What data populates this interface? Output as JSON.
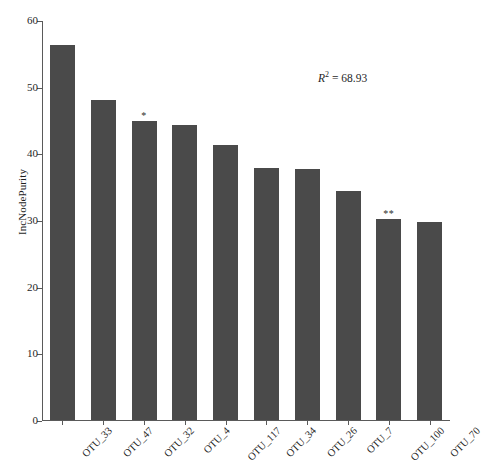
{
  "chart_data": {
    "type": "bar",
    "title": "",
    "xlabel": "",
    "ylabel": "IncNodePurity",
    "ylim": [
      0,
      60
    ],
    "yticks": [
      0,
      10,
      20,
      30,
      40,
      50,
      60
    ],
    "grid": false,
    "legend": null,
    "bar_color": "#4a4a4a",
    "categories": [
      "OTU_33",
      "OTU_47",
      "OTU_32",
      "OTU_4",
      "OTU_117",
      "OTU_34",
      "OTU_26",
      "OTU_7",
      "OTU_100",
      "OTU_70"
    ],
    "values": [
      56.2,
      48.0,
      44.8,
      44.3,
      41.2,
      37.8,
      37.6,
      34.3,
      30.1,
      29.7
    ],
    "significance": [
      "",
      "",
      "*",
      "",
      "",
      "",
      "",
      "",
      "**",
      ""
    ],
    "annotations": [
      {
        "name": "r-squared",
        "symbol": "R",
        "exponent": "2",
        "operator": " = ",
        "value": "68.93",
        "full_text": "R2 = 68.93"
      }
    ]
  }
}
